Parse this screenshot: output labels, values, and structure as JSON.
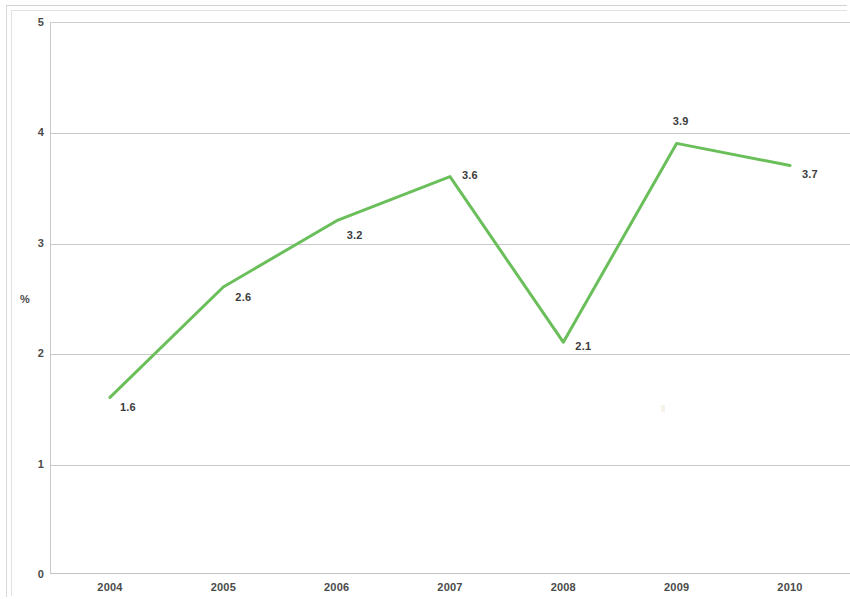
{
  "chart_data": {
    "type": "line",
    "title": "",
    "subtitle": "",
    "xlabel": "",
    "ylabel": "%",
    "categories": [
      "2004",
      "2005",
      "2006",
      "2007",
      "2008",
      "2009",
      "2010"
    ],
    "values": [
      1.6,
      2.6,
      3.2,
      3.6,
      2.1,
      3.9,
      3.7
    ],
    "point_labels": [
      "1.6",
      "2.6",
      "3.2",
      "3.6",
      "2.1",
      "3.9",
      "3.7"
    ],
    "series": [
      {
        "name": "",
        "values": [
          1.6,
          2.6,
          3.2,
          3.6,
          2.1,
          3.9,
          3.7
        ],
        "color": "#6abf5a"
      }
    ],
    "ylim": [
      0,
      5
    ],
    "y_ticks": [
      "0",
      "1",
      "2",
      "3",
      "4",
      "5"
    ],
    "y_tick_values": [
      0,
      1,
      2,
      3,
      4,
      5
    ],
    "x_ticks": [
      "2004",
      "2005",
      "2006",
      "2007",
      "2008",
      "2009",
      "2010"
    ],
    "grid": true,
    "grid_axis": "y",
    "legend": false,
    "legend_position": "none",
    "markers": false,
    "line_width": 3,
    "annotations": []
  },
  "colors": {
    "series_green": "#6abf5a",
    "gridline": "#c9c9c9",
    "axis": "#c4c4c4",
    "text": "#4a4a4a",
    "background": "#ffffff"
  },
  "axis": {
    "y_title": "%",
    "y_ticks": [
      {
        "label": "5",
        "value": 5
      },
      {
        "label": "4",
        "value": 4
      },
      {
        "label": "3",
        "value": 3
      },
      {
        "label": "2",
        "value": 2
      },
      {
        "label": "1",
        "value": 1
      },
      {
        "label": "0",
        "value": 0
      }
    ],
    "x_ticks": [
      {
        "label": "2004"
      },
      {
        "label": "2005"
      },
      {
        "label": "2006"
      },
      {
        "label": "2007"
      },
      {
        "label": "2008"
      },
      {
        "label": "2009"
      },
      {
        "label": "2010"
      }
    ]
  },
  "points": [
    {
      "x": "2004",
      "y": 1.6,
      "label": "1.6"
    },
    {
      "x": "2005",
      "y": 2.6,
      "label": "2.6"
    },
    {
      "x": "2006",
      "y": 3.2,
      "label": "3.2"
    },
    {
      "x": "2007",
      "y": 3.6,
      "label": "3.6"
    },
    {
      "x": "2008",
      "y": 2.1,
      "label": "2.1"
    },
    {
      "x": "2009",
      "y": 3.9,
      "label": "3.9"
    },
    {
      "x": "2010",
      "y": 3.7,
      "label": "3.7"
    }
  ]
}
